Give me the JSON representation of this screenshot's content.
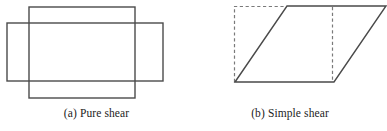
{
  "figure": {
    "background_color": "#ffffff",
    "stroke_color": "#4a4a4a",
    "dashed_color": "#7a7a7a",
    "text_color": "#1c1c1c",
    "panels": [
      {
        "id": "pure-shear",
        "caption_label": "(a)",
        "caption_text": "Pure shear",
        "shapes": [
          {
            "name": "tall-rectangle",
            "type": "rect",
            "x": 29,
            "y": 7,
            "width": 106,
            "height": 91,
            "style": "solid"
          },
          {
            "name": "wide-rectangle",
            "type": "rect",
            "x": 7,
            "y": 23,
            "width": 156,
            "height": 58,
            "style": "solid"
          }
        ]
      },
      {
        "id": "simple-shear",
        "caption_label": "(b)",
        "caption_text": "Simple shear",
        "shapes": [
          {
            "name": "original-square-outline",
            "type": "dashed-square",
            "points": "41,82 41,6 94,6 140,6 140,82",
            "style": "dashed"
          },
          {
            "name": "sheared-parallelogram",
            "type": "polygon",
            "points": "42,82 94,6 193,6 141,82",
            "style": "solid"
          }
        ]
      }
    ]
  }
}
